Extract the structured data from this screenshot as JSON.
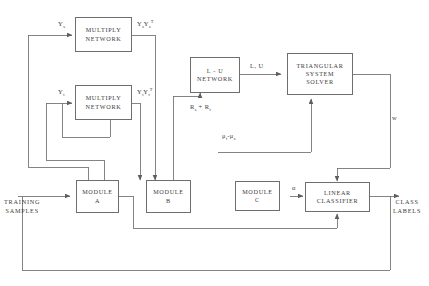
{
  "diagram": {
    "stroke_color": "#6e6e6e",
    "text_color": "#3a3a3a",
    "background": "#ffffff",
    "nodes": [
      {
        "id": "multiply_s",
        "lines": [
          "MULTIPLY",
          "NETWORK"
        ]
      },
      {
        "id": "multiply_t",
        "lines": [
          "MULTIPLY",
          "NETWORK"
        ]
      },
      {
        "id": "lu_network",
        "lines": [
          "L - U",
          "NETWORK"
        ]
      },
      {
        "id": "triangular_solver",
        "lines": [
          "TRIANGULAR",
          "SYSTEM",
          "SOLVER"
        ]
      },
      {
        "id": "module_a",
        "lines": [
          "MODULE",
          "A"
        ]
      },
      {
        "id": "module_b",
        "lines": [
          "MODULE",
          "B"
        ]
      },
      {
        "id": "module_c",
        "lines": [
          "MODULE",
          "C"
        ]
      },
      {
        "id": "linear_classifier",
        "lines": [
          "LINEAR",
          "CLASSIFIER"
        ]
      }
    ],
    "edge_labels": {
      "y_s": {
        "base": "Y",
        "sub": "s"
      },
      "y_t": {
        "base": "Y",
        "sub": "t"
      },
      "ys_yst": {
        "b1": "Y",
        "s1": "s",
        "b2": "Y",
        "s2": "s",
        "sup2": "T"
      },
      "yt_ytt": {
        "b1": "Y",
        "s1": "t",
        "b2": "Y",
        "s2": "t",
        "sup2": "T"
      },
      "rs_plus_rt": {
        "b1": "R",
        "s1": "s",
        "op": "+",
        "b2": "R",
        "s2": "t"
      },
      "l_u": "L, U",
      "mu_diff": {
        "b1": "μ",
        "s1": "t",
        "op": "-",
        "b2": "μ",
        "s2": "s"
      },
      "alpha": "α",
      "w": "w"
    },
    "io_labels": {
      "training_samples": "TRAINING\nSAMPLES",
      "class_labels": "CLASS\nLABELS"
    }
  }
}
